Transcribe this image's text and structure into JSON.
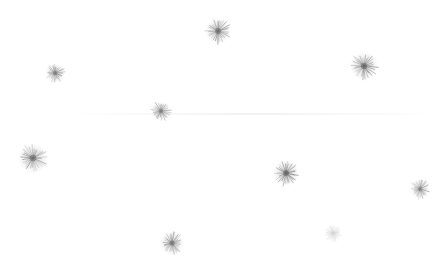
{
  "scene": {
    "description": "White background with scattered soft grey spiky star-burst particles",
    "background_color": "#ffffff",
    "particle_color": "#555555",
    "width": 448,
    "height": 278
  },
  "particles": [
    {
      "x": 218,
      "y": 31,
      "r": 13,
      "opacity": 0.85
    },
    {
      "x": 55,
      "y": 73,
      "r": 10,
      "opacity": 0.75
    },
    {
      "x": 364,
      "y": 66,
      "r": 14,
      "opacity": 0.9
    },
    {
      "x": 161,
      "y": 111,
      "r": 10,
      "opacity": 0.75
    },
    {
      "x": 33,
      "y": 158,
      "r": 15,
      "opacity": 0.85
    },
    {
      "x": 286,
      "y": 173,
      "r": 13,
      "opacity": 0.9
    },
    {
      "x": 420,
      "y": 189,
      "r": 10,
      "opacity": 0.7
    },
    {
      "x": 172,
      "y": 243,
      "r": 12,
      "opacity": 0.8
    },
    {
      "x": 333,
      "y": 233,
      "r": 9,
      "opacity": 0.25
    }
  ],
  "streaks": [
    {
      "x": 70,
      "y": 113,
      "w": 370
    }
  ]
}
